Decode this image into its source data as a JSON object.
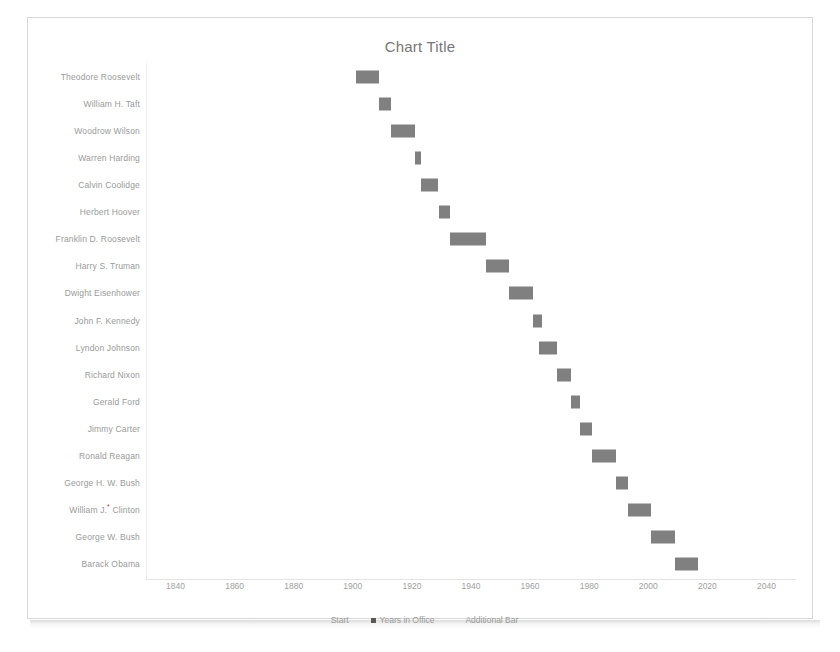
{
  "chart_data": {
    "type": "bar",
    "subtype": "stacked-horizontal-gantt",
    "title": "Chart Title",
    "xlabel": "",
    "ylabel": "",
    "xlim": [
      1830,
      2050
    ],
    "xticks": [
      1840,
      1860,
      1880,
      1900,
      1920,
      1940,
      1960,
      1980,
      2000,
      2020,
      2040
    ],
    "grid": false,
    "legend_position": "bottom",
    "bar_color": "#808080",
    "series": [
      {
        "name": "Start",
        "visible": false,
        "values": [
          1901,
          1909,
          1913,
          1921,
          1923,
          1929,
          1933,
          1945,
          1953,
          1961,
          1963,
          1969,
          1974,
          1977,
          1981,
          1989,
          1993,
          2001,
          2009
        ]
      },
      {
        "name": "Years in Office",
        "visible": true,
        "values": [
          8,
          4,
          8,
          2,
          6,
          4,
          12,
          8,
          8,
          3,
          6,
          5,
          3,
          4,
          8,
          4,
          8,
          8,
          8
        ]
      },
      {
        "name": "Additional Bar",
        "visible": false,
        "values": [
          0,
          0,
          0,
          0,
          0,
          0,
          0,
          0,
          0,
          0,
          0,
          0,
          0,
          0,
          0,
          0,
          0,
          0,
          0
        ]
      }
    ],
    "categories": [
      "Theodore Roosevelt",
      "William H. Taft",
      "Woodrow Wilson",
      "Warren Harding",
      "Calvin Coolidge",
      "Herbert Hoover",
      "Franklin D. Roosevelt",
      "Harry S. Truman",
      "Dwight Eisenhower",
      "John F. Kennedy",
      "Lyndon Johnson",
      "Richard Nixon",
      "Gerald Ford",
      "Jimmy Carter",
      "Ronald Reagan",
      "George H. W. Bush",
      "William J. Clinton",
      "George W. Bush",
      "Barack Obama"
    ],
    "category_footnotes": {
      "William J. Clinton": "*"
    }
  },
  "legend": [
    {
      "label": "Start",
      "swatch_color": "transparent"
    },
    {
      "label": "Years in Office",
      "swatch_color": "#595959"
    },
    {
      "label": "Additional Bar",
      "swatch_color": "transparent"
    }
  ],
  "colors": {
    "bar": "#808080",
    "text": "#9a9a9a",
    "title": "#777777",
    "frame": "#d8d8d8",
    "footnote": "#c0392b",
    "background": "#ffffff"
  }
}
